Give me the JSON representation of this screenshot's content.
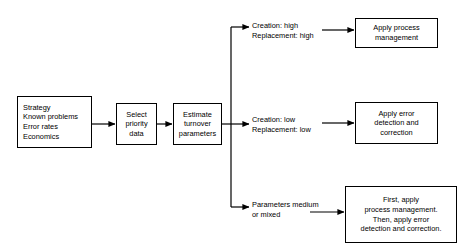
{
  "diagram": {
    "background_color": "#ffffff",
    "line_color": "#000000",
    "nodes": {
      "inputs": "Strategy\nKnown problems\nError rates\nEconomics",
      "select_priority": "Select\npriority\ndata",
      "estimate": "Estimate\nturnover\nparameters",
      "apply_process_management": "Apply process\nmanagement",
      "apply_error_detection": "Apply error\ndetection and\ncorrection",
      "apply_both": "First, apply\nprocess management.\nThen, apply error\ndetection and correction."
    },
    "edge_labels": {
      "branch_high": "Creation:  high\nReplacement:  high",
      "branch_low": "Creation:  low\nReplacement: low",
      "branch_mixed": "Parameters medium\nor mixed"
    }
  }
}
